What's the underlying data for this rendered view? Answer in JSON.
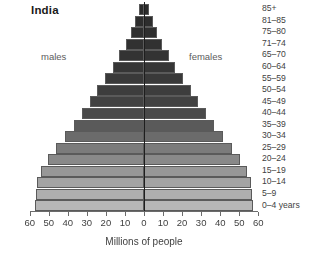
{
  "chart_data": {
    "type": "bar",
    "title": "India",
    "subtitle": "",
    "xlabel": "Millions of people",
    "ylabel": "",
    "orientation": "population-pyramid",
    "grid": false,
    "legend_position": "inline",
    "xlim": [
      -60,
      60
    ],
    "xticks": [
      60,
      50,
      40,
      30,
      20,
      10,
      0,
      10,
      20,
      30,
      40,
      50,
      60
    ],
    "xtick_labels": [
      "60",
      "50",
      "40",
      "30",
      "20",
      "10",
      "0",
      "10",
      "20",
      "30",
      "40",
      "50",
      "60"
    ],
    "annotations": [
      "males",
      "females"
    ],
    "categories": [
      "85+",
      "81–85",
      "75–80",
      "71–74",
      "65–70",
      "60–64",
      "55–59",
      "50–54",
      "45–49",
      "40–44",
      "35–39",
      "30–34",
      "25–29",
      "20–24",
      "15–19",
      "10–14",
      "5–9",
      "0–4 years"
    ],
    "series": [
      {
        "name": "males",
        "values": [
          2.5,
          4.5,
          7.0,
          9.5,
          13.0,
          16.5,
          20.5,
          24.5,
          28.5,
          32.5,
          37.0,
          41.5,
          46.0,
          50.5,
          54.0,
          56.0,
          56.5,
          57.0
        ]
      },
      {
        "name": "females",
        "values": [
          2.5,
          4.5,
          7.0,
          9.5,
          13.0,
          16.5,
          20.5,
          24.5,
          28.5,
          32.5,
          37.0,
          41.5,
          46.0,
          50.5,
          54.0,
          56.0,
          56.5,
          57.0
        ]
      }
    ],
    "bar_colors": [
      "#2b2b2b",
      "#2d2d2d",
      "#2f2f2f",
      "#313131",
      "#333333",
      "#363636",
      "#393939",
      "#3d3d3d",
      "#424242",
      "#4a4a4a",
      "#5a5a5a",
      "#6b6b6b",
      "#7b7b7b",
      "#898989",
      "#979797",
      "#a3a3a3",
      "#aeaeae",
      "#b7b7b7"
    ]
  },
  "colors": {
    "background": "#ffffff",
    "axis": "#6b6b6b",
    "center_axis": "#1e1e1e",
    "text": "#3f3f3f",
    "title_text": "#1a1a1a",
    "annotation_text": "#5c5c5c",
    "bar_outline": "#5a5a5a"
  }
}
